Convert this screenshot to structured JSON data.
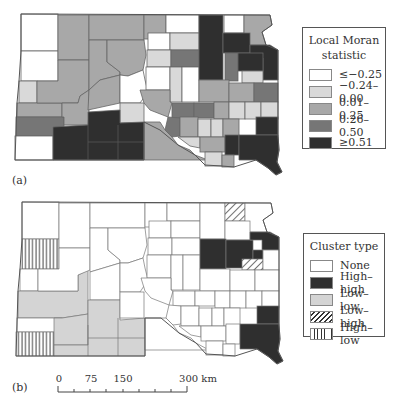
{
  "panels": [
    {
      "id": "a",
      "label": "(a)"
    },
    {
      "id": "b",
      "label": "(b)"
    }
  ],
  "legend_a": {
    "title_line1": "Local Moran",
    "title_line2": "statistic",
    "items": [
      {
        "label": "≤−0.25",
        "color": "#ffffff"
      },
      {
        "label": "−0.24–0.00",
        "color": "#d9d9d9"
      },
      {
        "label": "0.01–0.25",
        "color": "#a8a8a8"
      },
      {
        "label": "0.26–0.50",
        "color": "#767676"
      },
      {
        "label": "≥0.51",
        "color": "#2f2f2f"
      }
    ]
  },
  "legend_b": {
    "title": "Cluster type",
    "items": [
      {
        "label": "None",
        "pattern": "none"
      },
      {
        "label": "High–high",
        "pattern": "solid-dark"
      },
      {
        "label": "Low–low",
        "pattern": "solid-light"
      },
      {
        "label": "Low–high",
        "pattern": "diagonal-hatch"
      },
      {
        "label": "High–low",
        "pattern": "vertical-hatch"
      }
    ]
  },
  "scale_bar": {
    "ticks": [
      "0",
      "75",
      "150",
      "300 km"
    ],
    "unit": "km"
  },
  "colors": {
    "border": "#555555",
    "high_high": "#2f2f2f",
    "low_low": "#d4d4d4"
  }
}
